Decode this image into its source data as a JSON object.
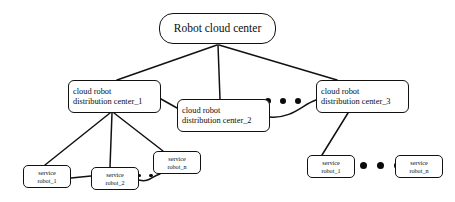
{
  "diagram": {
    "background_color": "#ffffff",
    "line_color": "#111111",
    "node_fill": "#ffffff",
    "nodes": {
      "root": {
        "label": "Robot cloud center"
      },
      "distribution_centers": [
        {
          "line1": "cloud robot",
          "line2": "distribution center_1"
        },
        {
          "line1": "cloud robot",
          "line2": "distribution center_2"
        },
        {
          "line1": "cloud robot",
          "line2": "distribution center_3"
        }
      ],
      "left_service_robots": [
        {
          "line1": "service",
          "line2": "robot_1"
        },
        {
          "line1": "service",
          "line2": "robot_2"
        },
        {
          "line1": "service",
          "line2": "robot_n"
        }
      ],
      "right_service_robots": [
        {
          "line1": "service",
          "line2": "robot_1"
        },
        {
          "line1": "service",
          "line2": "robot_n"
        }
      ]
    },
    "ellipses": {
      "between_centers": 3,
      "left_robots": 2,
      "right_robots": 3
    }
  }
}
